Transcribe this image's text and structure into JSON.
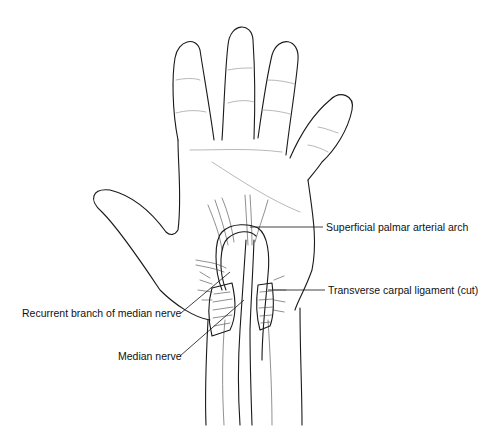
{
  "figure": {
    "labels": [
      {
        "id": "superficial_palmar_arch",
        "text": "Superficial palmar arterial arch"
      },
      {
        "id": "transverse_carpal_ligament",
        "text": "Transverse carpal ligament (cut)"
      },
      {
        "id": "recurrent_branch",
        "text": "Recurrent branch of median nerve"
      },
      {
        "id": "median_nerve",
        "text": "Median nerve"
      }
    ],
    "colors": {
      "line": "#1a1a1a",
      "background": "#ffffff",
      "text": "#111111"
    }
  }
}
